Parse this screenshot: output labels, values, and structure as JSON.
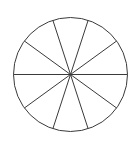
{
  "figure": {
    "name": "circle-divided-into-ten-equal-sectors",
    "background_color": "#ffffff",
    "canvas": {
      "width": 140,
      "height": 147
    }
  },
  "geometry": {
    "center_x": 70.5,
    "center_y": 74.5,
    "radius": 57,
    "stroke_color": "#3a3a3a",
    "stroke_width": 1,
    "fill_color": "none",
    "sector_count": 10,
    "diameter_count": 5,
    "sector_angle_degrees": 36,
    "start_angle_degrees": 0,
    "boundary_angles_degrees": [
      0,
      36,
      72,
      108,
      144,
      180,
      216,
      252,
      288,
      324
    ],
    "bounds": {
      "left": 13,
      "right": 128,
      "top": 12,
      "bottom": 137
    }
  },
  "chart_data": {
    "type": "pie",
    "title": "",
    "subtitle": "",
    "xlabel": "",
    "ylabel": "",
    "grid": false,
    "legend": false,
    "legend_position": "none",
    "labels": [
      "1",
      "2",
      "3",
      "4",
      "5",
      "6",
      "7",
      "8",
      "9",
      "10"
    ],
    "values": [
      10,
      10,
      10,
      10,
      10,
      10,
      10,
      10,
      10,
      10
    ],
    "percentages": [
      10,
      10,
      10,
      10,
      10,
      10,
      10,
      10,
      10,
      10
    ],
    "slice_angle_degrees": 36,
    "total": 100,
    "colors": [
      "none",
      "none",
      "none",
      "none",
      "none",
      "none",
      "none",
      "none",
      "none",
      "none"
    ],
    "stroke": "#3a3a3a",
    "annotations": []
  }
}
